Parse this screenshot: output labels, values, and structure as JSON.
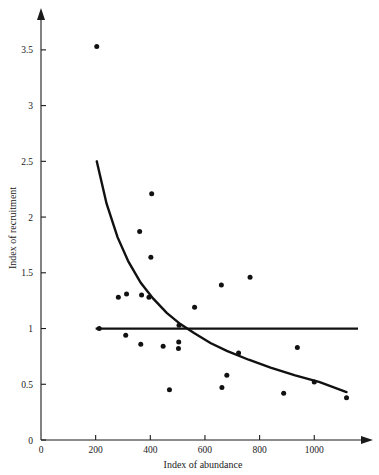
{
  "chart_data": {
    "type": "scatter",
    "title": "",
    "xlabel": "Index of abundance",
    "ylabel": "Index of recruitment",
    "xlim": [
      0,
      1160
    ],
    "ylim": [
      0,
      3.75
    ],
    "grid": false,
    "legend": null,
    "xticks": [
      0,
      200,
      400,
      600,
      800,
      1000
    ],
    "xtick_labels": [
      "0",
      "200",
      "400",
      "600",
      "800",
      "1000"
    ],
    "yticks": [
      0,
      0.5,
      1,
      1.5,
      2,
      2.5,
      3,
      3.5
    ],
    "ytick_labels": [
      "0",
      "0.5",
      "1",
      "1.5",
      "2",
      "2.5",
      "3",
      "3.5"
    ],
    "points": [
      {
        "x": 204,
        "y": 3.53
      },
      {
        "x": 405,
        "y": 2.21
      },
      {
        "x": 361,
        "y": 1.87
      },
      {
        "x": 402,
        "y": 1.64
      },
      {
        "x": 765,
        "y": 1.46
      },
      {
        "x": 660,
        "y": 1.39
      },
      {
        "x": 368,
        "y": 1.3
      },
      {
        "x": 313,
        "y": 1.31
      },
      {
        "x": 283,
        "y": 1.28
      },
      {
        "x": 395,
        "y": 1.28
      },
      {
        "x": 562,
        "y": 1.19
      },
      {
        "x": 505,
        "y": 1.03
      },
      {
        "x": 213,
        "y": 1.0
      },
      {
        "x": 310,
        "y": 0.94
      },
      {
        "x": 504,
        "y": 0.88
      },
      {
        "x": 365,
        "y": 0.86
      },
      {
        "x": 447,
        "y": 0.84
      },
      {
        "x": 503,
        "y": 0.82
      },
      {
        "x": 938,
        "y": 0.83
      },
      {
        "x": 723,
        "y": 0.78
      },
      {
        "x": 680,
        "y": 0.58
      },
      {
        "x": 1000,
        "y": 0.52
      },
      {
        "x": 470,
        "y": 0.45
      },
      {
        "x": 662,
        "y": 0.47
      },
      {
        "x": 888,
        "y": 0.42
      },
      {
        "x": 1118,
        "y": 0.38
      }
    ],
    "series": [
      {
        "name": "fitted-decay-curve",
        "type": "line",
        "points": [
          {
            "x": 204,
            "y": 2.5
          },
          {
            "x": 240,
            "y": 2.12
          },
          {
            "x": 280,
            "y": 1.82
          },
          {
            "x": 320,
            "y": 1.6
          },
          {
            "x": 365,
            "y": 1.41
          },
          {
            "x": 410,
            "y": 1.27
          },
          {
            "x": 460,
            "y": 1.14
          },
          {
            "x": 510,
            "y": 1.04
          },
          {
            "x": 560,
            "y": 0.96
          },
          {
            "x": 620,
            "y": 0.87
          },
          {
            "x": 680,
            "y": 0.8
          },
          {
            "x": 760,
            "y": 0.72
          },
          {
            "x": 840,
            "y": 0.65
          },
          {
            "x": 930,
            "y": 0.58
          },
          {
            "x": 1020,
            "y": 0.52
          },
          {
            "x": 1118,
            "y": 0.43
          }
        ]
      },
      {
        "name": "replacement-reference-line",
        "type": "line",
        "points": [
          {
            "x": 200,
            "y": 1.0
          },
          {
            "x": 1160,
            "y": 1.0
          }
        ]
      }
    ]
  },
  "axes": {
    "x_axis_label": "Index of abundance",
    "y_axis_label": "Index of recruitment"
  }
}
